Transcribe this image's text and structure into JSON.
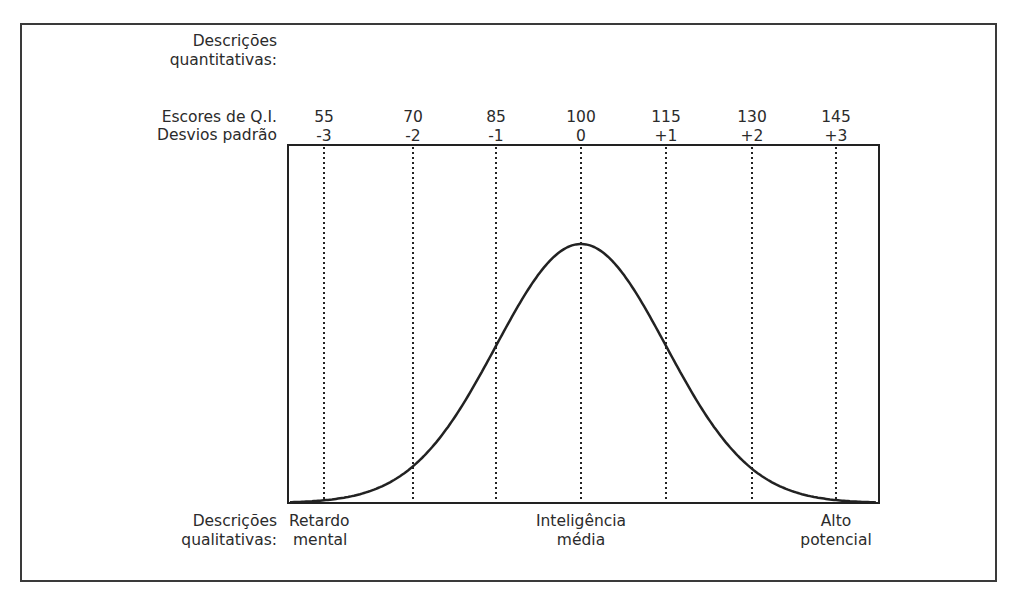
{
  "diagram": {
    "left_labels": {
      "quantitative_line1": "Descrições",
      "quantitative_line2": "quantitativas:",
      "iq_scores": "Escores de Q.I.",
      "std_devs": "Desvios padrão",
      "qualitative_line1": "Descrições",
      "qualitative_line2": "qualitativas:"
    },
    "ticks": [
      {
        "iq": "55",
        "sd": "-3"
      },
      {
        "iq": "70",
        "sd": "-2"
      },
      {
        "iq": "85",
        "sd": "-1"
      },
      {
        "iq": "100",
        "sd": "0"
      },
      {
        "iq": "115",
        "sd": "+1"
      },
      {
        "iq": "130",
        "sd": "+2"
      },
      {
        "iq": "145",
        "sd": "+3"
      }
    ],
    "qualitative": [
      {
        "line1": "Retardo",
        "line2": "mental"
      },
      {
        "line1": "Inteligência",
        "line2": "média"
      },
      {
        "line1": "Alto",
        "line2": "potencial"
      }
    ],
    "colors": {
      "line": "#222222",
      "text": "#2b2b2b",
      "frame": "#3a3a3a"
    }
  },
  "chart_data": {
    "type": "line",
    "xlabel": "Escores de Q.I. / Desvios padrão",
    "ylabel": "",
    "x": [
      55,
      70,
      85,
      100,
      115,
      130,
      145
    ],
    "x_tick_labels_secondary": [
      "-3",
      "-2",
      "-1",
      "0",
      "+1",
      "+2",
      "+3"
    ],
    "series": [
      {
        "name": "Distribuição normal",
        "values": [
          0.004,
          0.054,
          0.242,
          0.399,
          0.242,
          0.054,
          0.004
        ]
      }
    ],
    "grid": "vertical dotted lines at each standard deviation",
    "annotations": [
      "Retardo mental",
      "Inteligência média",
      "Alto potencial"
    ]
  }
}
